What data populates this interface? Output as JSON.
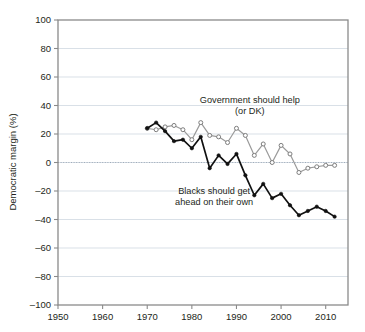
{
  "chart_data": {
    "type": "line",
    "title": "",
    "subtitle": "",
    "xlabel": "",
    "ylabel": "Democratic margin (%)",
    "xlim": [
      1950,
      2015
    ],
    "ylim": [
      -100,
      100
    ],
    "grid": true,
    "legend_position": "inline-annotations",
    "xticks": [
      1950,
      1960,
      1970,
      1980,
      1990,
      2000,
      2010
    ],
    "xtick_labels": [
      "1950",
      "1960",
      "1970",
      "1980",
      "1990",
      "2000",
      "2010"
    ],
    "yticks": [
      -100,
      -80,
      -60,
      -40,
      -20,
      0,
      20,
      40,
      60,
      80,
      100
    ],
    "ytick_labels": [
      "-100",
      "-80",
      "-60",
      "-40",
      "-20",
      "0",
      "20",
      "40",
      "60",
      "80",
      "100"
    ],
    "x": [
      1970,
      1972,
      1974,
      1976,
      1978,
      1980,
      1982,
      1984,
      1986,
      1988,
      1990,
      1992,
      1994,
      1996,
      1998,
      2000,
      2002,
      2004,
      2006,
      2008,
      2010,
      2012
    ],
    "series": [
      {
        "name": "Government should help (or DK)",
        "color": "#9a9a9a",
        "marker": "open-circle",
        "values": [
          24,
          23,
          25,
          26,
          23,
          16,
          28,
          19,
          18,
          14,
          24,
          19,
          5,
          13,
          0,
          12,
          6,
          -7,
          -4,
          -3,
          -2,
          -2
        ]
      },
      {
        "name": "Blacks should get ahead on their own",
        "color": "#111111",
        "marker": "filled-circle",
        "values": [
          24,
          28,
          22,
          15,
          16,
          10,
          18,
          -4,
          5,
          -1,
          6,
          -9,
          -23,
          -15,
          -25,
          -22,
          -30,
          -37,
          -34,
          -31,
          -34,
          -38
        ]
      }
    ],
    "annotations": [
      {
        "name": "government-should-help-label",
        "lines": [
          "Government should help",
          "(or DK)"
        ],
        "x": 1993,
        "y": 42
      },
      {
        "name": "blacks-should-get-ahead-label",
        "lines": [
          "Blacks should get",
          "ahead on their own"
        ],
        "x": 1985,
        "y": -22
      }
    ]
  }
}
